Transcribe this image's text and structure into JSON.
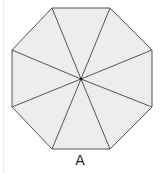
{
  "figure": {
    "label": "A",
    "shape": "regular-octagon",
    "fill_color": "#ededed",
    "stroke_color": "#555555",
    "divisions": 8,
    "center": [
      81,
      79
    ],
    "vertices": [
      [
        52,
        8
      ],
      [
        110,
        8
      ],
      [
        152,
        50
      ],
      [
        152,
        107
      ],
      [
        110,
        149
      ],
      [
        52,
        149
      ],
      [
        12,
        107
      ],
      [
        12,
        50
      ]
    ]
  }
}
